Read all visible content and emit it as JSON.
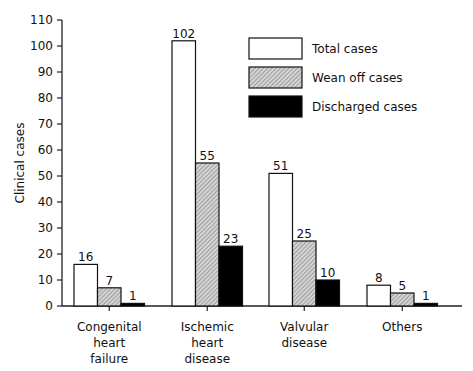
{
  "chart_data": {
    "type": "bar",
    "title": "",
    "xlabel": "",
    "ylabel": "Clinical cases",
    "ylim": [
      0,
      110
    ],
    "yticks": [
      0,
      10,
      20,
      30,
      40,
      50,
      60,
      70,
      80,
      90,
      100,
      110
    ],
    "grid": false,
    "legend_position": "upper right",
    "categories": [
      [
        "Congenital",
        "heart",
        "failure"
      ],
      [
        "Ischemic",
        "heart",
        "disease"
      ],
      [
        "Valvular",
        "disease"
      ],
      [
        "Others"
      ]
    ],
    "series": [
      {
        "name": "Total cases",
        "fill": "white",
        "values": [
          16,
          102,
          51,
          8
        ]
      },
      {
        "name": "Wean off cases",
        "fill": "hatched-gray",
        "values": [
          7,
          55,
          25,
          5
        ]
      },
      {
        "name": "Discharged cases",
        "fill": "black",
        "values": [
          1,
          23,
          10,
          1
        ]
      }
    ]
  },
  "colors": {
    "total": "#ffffff",
    "wean": "#bdbdbd",
    "discharged": "#000000",
    "axis": "#222222"
  }
}
